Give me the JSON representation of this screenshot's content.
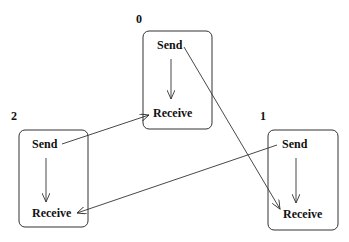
{
  "diagram": {
    "processes": [
      {
        "id": "0",
        "label": "0",
        "send": "Send",
        "receive": "Receive"
      },
      {
        "id": "1",
        "label": "1",
        "send": "Send",
        "receive": "Receive"
      },
      {
        "id": "2",
        "label": "2",
        "send": "Send",
        "receive": "Receive"
      }
    ],
    "messages": [
      {
        "from": "0.Send",
        "to": "1.Receive"
      },
      {
        "from": "1.Send",
        "to": "2.Receive"
      },
      {
        "from": "2.Send",
        "to": "0.Receive"
      }
    ]
  }
}
